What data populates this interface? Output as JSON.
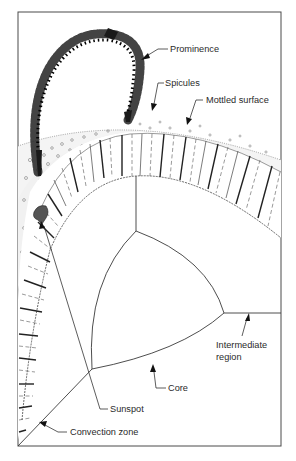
{
  "diagram": {
    "labels": {
      "prominence": "Prominence",
      "spicules": "Spicules",
      "mottled_surface": "Mottled surface",
      "intermediate_line1": "Intermediate",
      "intermediate_line2": "region",
      "core": "Core",
      "sunspot": "Sunspot",
      "convection_zone": "Convection zone"
    },
    "regions": [
      "Prominence",
      "Spicules",
      "Mottled surface",
      "Sunspot",
      "Convection zone",
      "Intermediate region",
      "Core"
    ],
    "colors": {
      "ink": "#2a2a2a",
      "background": "#ffffff",
      "sunspot": "#555555"
    }
  }
}
